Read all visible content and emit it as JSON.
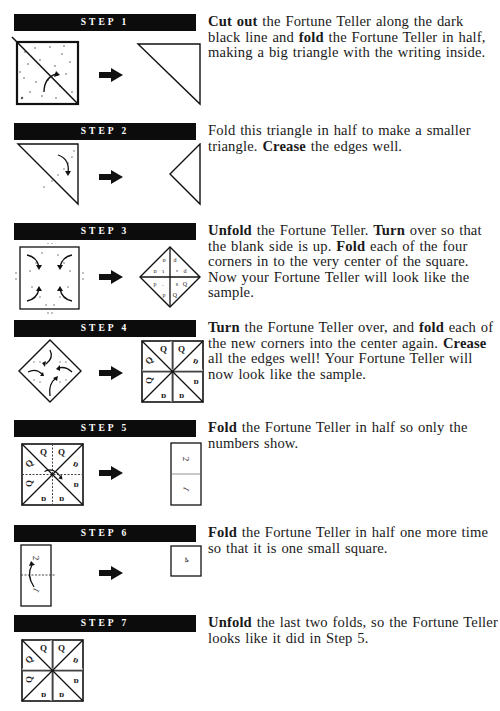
{
  "steps": [
    {
      "label": "STEP 1",
      "text": [
        {
          "b": "Cut out"
        },
        {
          "t": " the Fortune Teller along the dark black line and "
        },
        {
          "b": "fold"
        },
        {
          "t": " the Fortune Teller in half, making a big triangle with the writing inside."
        }
      ],
      "figures": [
        "dotted-square-with-diagonal-fold",
        "large-triangle"
      ]
    },
    {
      "label": "STEP 2",
      "text": [
        {
          "t": "Fold this triangle in half to make a smaller triangle. "
        },
        {
          "b": "Crease"
        },
        {
          "t": " the edges well."
        }
      ],
      "figures": [
        "triangle-with-fold-arrow",
        "small-triangle"
      ]
    },
    {
      "label": "STEP 3",
      "text": [
        {
          "b": "Unfold"
        },
        {
          "t": " the Fortune Teller. "
        },
        {
          "b": "Turn"
        },
        {
          "t": " over so that the blank side is up. "
        },
        {
          "b": "Fold"
        },
        {
          "t": " each of the four corners in to the very center of the square. Now your Fortune Teller will look like the sample."
        }
      ],
      "figures": [
        "square-with-four-corner-arrows",
        "diamond-sample"
      ]
    },
    {
      "label": "STEP 4",
      "text": [
        {
          "b": "Turn"
        },
        {
          "t": " the Fortune Teller over, and "
        },
        {
          "b": "fold"
        },
        {
          "t": " each of the new corners into the center again. "
        },
        {
          "b": "Crease"
        },
        {
          "t": " all the edges well! Your Fortune Teller will now look like the sample."
        }
      ],
      "figures": [
        "diamond-with-four-arrows",
        "eight-triangle-square"
      ]
    },
    {
      "label": "STEP 5",
      "text": [
        {
          "b": "Fold"
        },
        {
          "t": " the Fortune Teller in half so only the numbers show."
        }
      ],
      "figures": [
        "eight-triangle-square-with-fold",
        "tall-rectangle-numbers"
      ]
    },
    {
      "label": "STEP 6",
      "text": [
        {
          "b": "Fold"
        },
        {
          "t": " the Fortune Teller in half one more time so that it is one small square."
        }
      ],
      "figures": [
        "rectangle-with-fold-arrow",
        "small-square"
      ]
    },
    {
      "label": "STEP 7",
      "text": [
        {
          "b": "Unfold"
        },
        {
          "t": " the last two folds, so the Fortune Teller looks like it did in Step 5."
        }
      ],
      "figures": [
        "eight-triangle-square"
      ]
    }
  ],
  "glyphs": {
    "q": "Q",
    "d": "ɒ",
    "num1": "1",
    "num2": "2",
    "num4": "4"
  },
  "colors": {
    "bar": "#0c0c0c",
    "ink": "#1a1a1a",
    "paper": "#ffffff"
  }
}
